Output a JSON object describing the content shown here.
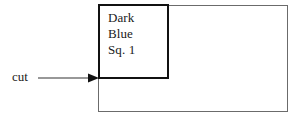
{
  "figure": {
    "name": "quilt-block-cutting-diagram",
    "background_color": "#ffffff"
  },
  "outer_rect": {
    "name": "fabric-rectangle",
    "stroke_color": "#6b6b6b",
    "stroke_width": 1
  },
  "inner_rect": {
    "name": "dark-blue-square-patch",
    "stroke_color": "#111111",
    "stroke_width": 2,
    "label_lines": [
      "Dark",
      "Blue",
      "Sq. 1"
    ]
  },
  "annotation": {
    "cut_label": "cut",
    "arrow_color": "#333333",
    "arrow_direction": "right"
  }
}
